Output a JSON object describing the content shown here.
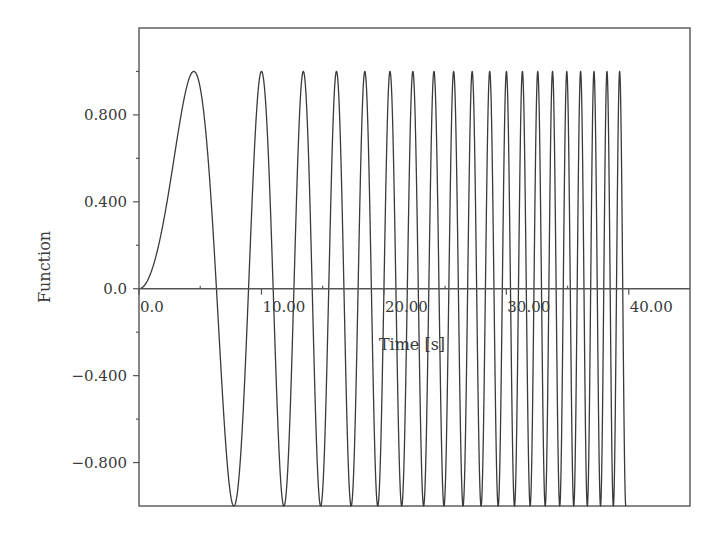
{
  "chart_data": {
    "type": "line",
    "title": "",
    "xlabel": "Time [s]",
    "ylabel": "Function",
    "xlim": [
      0,
      45
    ],
    "ylim": [
      -1.0,
      1.2
    ],
    "grid": false,
    "legend": null,
    "x_ticks": [
      0,
      10,
      20,
      30,
      40
    ],
    "x_tick_labels": [
      "0.0",
      "10.00",
      "20.00",
      "30.00",
      "40.00"
    ],
    "x_minor_ticks": [
      5,
      15,
      25,
      35
    ],
    "y_ticks": [
      -0.8,
      -0.4,
      0.0,
      0.4,
      0.8
    ],
    "y_tick_labels": [
      "−0.800",
      "−0.400",
      "0.0",
      "0.400",
      "0.800"
    ],
    "y_minor_ticks": [
      -0.6,
      -0.2,
      0.2,
      0.6,
      1.0
    ],
    "series": [
      {
        "name": "Function",
        "formula": "y = sin(a * t^2)",
        "a": 0.0785,
        "t_start": 0.0,
        "t_end": 39.76,
        "color": "#3a3a3a",
        "peaks_t": [
          4.47,
          9.75,
          13.2,
          16.1,
          18.5,
          20.4,
          22.3,
          24.1,
          25.6,
          27.2,
          28.6,
          29.9,
          31.3,
          32.5,
          33.7,
          34.9,
          36.0,
          37.1,
          38.2,
          39.26
        ],
        "peak_value": 1.0,
        "trough_value": -1.0
      }
    ]
  }
}
